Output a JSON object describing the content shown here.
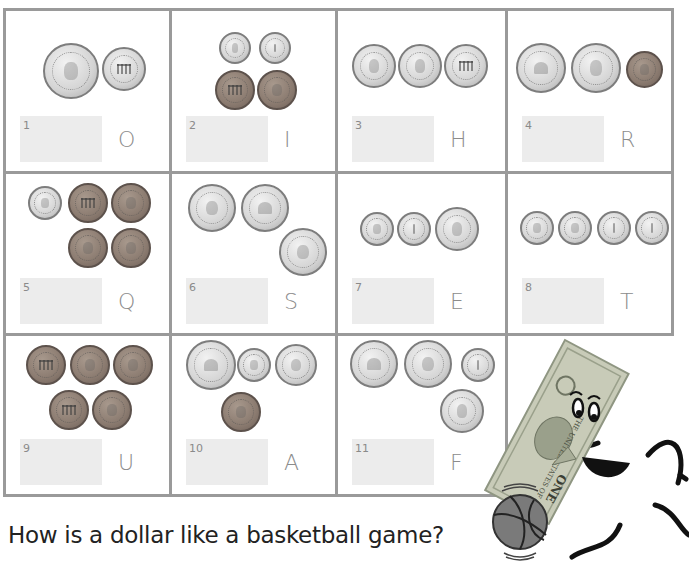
{
  "worksheet": {
    "question": "How is a dollar like a basketball game?",
    "colors": {
      "grid_line": "#9a9a9a",
      "answer_box": "#ececec",
      "letter": "#8c8c8c",
      "label": "#8a8a8a",
      "question_text": "#222222",
      "silver_coin": "#d4d4d4",
      "copper_coin": "#8b7b70",
      "dollar_bill": "#c8cbb8",
      "basketball": "#7a7a7a"
    },
    "cells": [
      {
        "number": "1",
        "letter": "O",
        "coins": [
          "quarter-heads",
          "nickel-tails"
        ]
      },
      {
        "number": "2",
        "letter": "I",
        "coins": [
          "dime-heads",
          "dime-tails",
          "penny-tails",
          "penny-heads"
        ]
      },
      {
        "number": "3",
        "letter": "H",
        "coins": [
          "nickel-heads",
          "nickel-heads",
          "nickel-tails"
        ]
      },
      {
        "number": "4",
        "letter": "R",
        "coins": [
          "quarter-tails",
          "quarter-heads",
          "penny-heads"
        ]
      },
      {
        "number": "5",
        "letter": "Q",
        "coins": [
          "dime-heads",
          "penny-tails",
          "penny-heads",
          "penny-heads",
          "penny-heads"
        ]
      },
      {
        "number": "6",
        "letter": "S",
        "coins": [
          "quarter-heads",
          "quarter-tails",
          "quarter-heads"
        ]
      },
      {
        "number": "7",
        "letter": "E",
        "coins": [
          "dime-heads",
          "dime-tails",
          "nickel-heads"
        ]
      },
      {
        "number": "8",
        "letter": "T",
        "coins": [
          "dime-heads",
          "dime-heads",
          "dime-tails",
          "dime-tails"
        ]
      },
      {
        "number": "9",
        "letter": "U",
        "coins": [
          "penny-tails",
          "penny-heads",
          "penny-heads",
          "penny-tails",
          "penny-heads"
        ]
      },
      {
        "number": "10",
        "letter": "A",
        "coins": [
          "quarter-tails",
          "dime-heads",
          "nickel-heads",
          "penny-heads"
        ]
      },
      {
        "number": "11",
        "letter": "F",
        "coins": [
          "quarter-tails",
          "quarter-heads",
          "dime-tails",
          "nickel-heads"
        ]
      }
    ],
    "illustration": {
      "subject": "dollar-bill-mascot-dribbling-basketball",
      "bill_text": "THE UNITED STATES OF AMERICA",
      "bill_denomination": "ONE"
    }
  }
}
